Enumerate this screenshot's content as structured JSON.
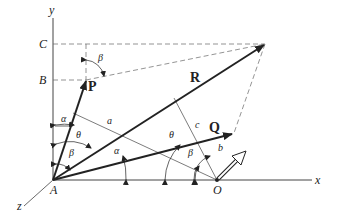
{
  "diagram": {
    "axes": {
      "x": "x",
      "y": "y",
      "z": "z"
    },
    "points": {
      "A": "A",
      "B": "B",
      "C": "C",
      "O": "O"
    },
    "vectors": {
      "P": "P",
      "Q": "Q",
      "R": "R"
    },
    "segments": {
      "a": "a",
      "b": "b",
      "c": "c"
    },
    "angles": {
      "alpha_top": "α",
      "beta_top": "β",
      "theta_left": "θ",
      "beta_left": "β",
      "alpha_mid": "α",
      "theta_right": "θ",
      "beta_right": "β"
    },
    "colors": {
      "line": "#222222",
      "dashed": "#666666",
      "background": "#ffffff"
    }
  }
}
